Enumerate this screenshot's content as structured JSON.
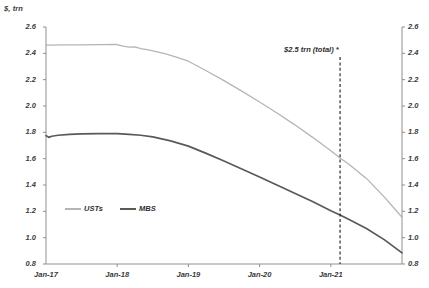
{
  "chart_data": {
    "type": "line",
    "title": "",
    "ylabel": "$, trn",
    "xlabel": "",
    "ylim": [
      0.8,
      2.6
    ],
    "ytick_step": 0.2,
    "yticks": [
      "2.6",
      "2.4",
      "2.2",
      "2.0",
      "1.8",
      "1.6",
      "1.4",
      "1.2",
      "1.0",
      "0.8"
    ],
    "yticks_right": [
      "2.6",
      "2.4",
      "2.2",
      "2.0",
      "1.8",
      "1.6",
      "1.4",
      "1.2",
      "1.0",
      "0.8"
    ],
    "categories": [
      "Jan-17",
      "Jan-18",
      "Jan-19",
      "Jan-20",
      "Jan-21"
    ],
    "xticks": [
      "Jan-17",
      "Jan-18",
      "Jan-19",
      "Jan-20",
      "Jan-21"
    ],
    "grid": false,
    "legend_position": "inside-lower-left",
    "series": [
      {
        "name": "USTs",
        "color": "#b5b5b5",
        "x": [
          2017.0,
          2017.25,
          2017.5,
          2017.75,
          2018.0,
          2018.08,
          2018.17,
          2018.25,
          2018.33,
          2018.42,
          2018.5,
          2018.67,
          2018.83,
          2019.0,
          2019.25,
          2019.5,
          2019.75,
          2020.0,
          2020.25,
          2020.5,
          2020.75,
          2021.0,
          2021.13,
          2021.25,
          2021.5,
          2021.75,
          2022.0
        ],
        "values": [
          2.463,
          2.464,
          2.465,
          2.466,
          2.467,
          2.455,
          2.447,
          2.449,
          2.436,
          2.428,
          2.418,
          2.398,
          2.372,
          2.34,
          2.268,
          2.193,
          2.113,
          2.03,
          1.945,
          1.855,
          1.76,
          1.66,
          1.605,
          1.56,
          1.45,
          1.31,
          1.155
        ]
      },
      {
        "name": "MBS",
        "color": "#595959",
        "x": [
          2017.0,
          2017.04,
          2017.08,
          2017.17,
          2017.33,
          2017.5,
          2017.75,
          2018.0,
          2018.17,
          2018.33,
          2018.5,
          2018.75,
          2019.0,
          2019.25,
          2019.5,
          2019.75,
          2020.0,
          2020.25,
          2020.5,
          2020.75,
          2021.0,
          2021.13,
          2021.25,
          2021.5,
          2021.75,
          2022.0
        ],
        "values": [
          1.775,
          1.762,
          1.77,
          1.778,
          1.785,
          1.788,
          1.79,
          1.79,
          1.785,
          1.778,
          1.766,
          1.735,
          1.695,
          1.64,
          1.582,
          1.522,
          1.46,
          1.398,
          1.335,
          1.272,
          1.205,
          1.172,
          1.14,
          1.07,
          0.985,
          0.885
        ]
      }
    ],
    "annotations": [
      {
        "text": "$2.5 trn (total) *",
        "x_value": 2021.13,
        "marker": "dashed-vertical-line",
        "color": "#1a1a1a"
      }
    ]
  },
  "legend": {
    "items": [
      {
        "label": "USTs",
        "color": "#b5b5b5"
      },
      {
        "label": "MBS",
        "color": "#595959"
      }
    ]
  }
}
